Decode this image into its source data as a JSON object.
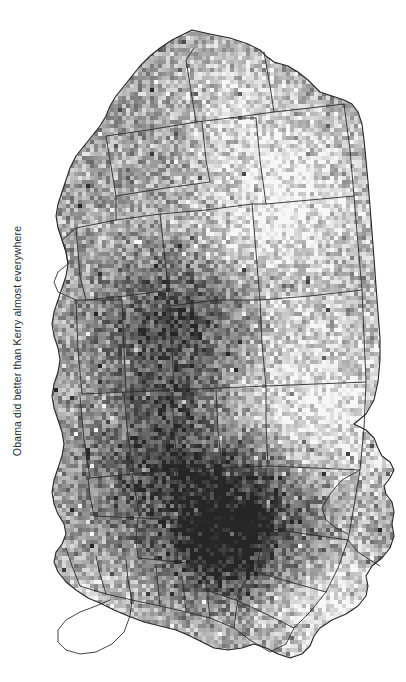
{
  "figure": {
    "caption": "Obama did better than Kerry almost everywhere",
    "caption_orientation": "vertical-rotated-90-ccw",
    "background_color": "#ffffff",
    "text_color": "#2b2b2b"
  },
  "chart_data": {
    "type": "heatmap",
    "subtype": "choropleth-county-map",
    "title": "Obama did better than Kerry almost everywhere",
    "subtitle": "",
    "xlabel": "",
    "ylabel": "",
    "region": "United States (contiguous 48 states), county level",
    "map_rotation_degrees": -90,
    "grid": false,
    "legend": false,
    "legend_position": "none",
    "colormap": "grayscale",
    "colormap_low": "#f7f7f7",
    "colormap_high": "#262626",
    "border_color": "#2e2e2e",
    "value_description": "Swing toward Obama in 2008 relative to Kerry in 2004, by county",
    "value_unit": "percentage points",
    "value_range": [
      -10,
      35
    ],
    "series": [
      {
        "name": "County swing (Obama 2008 minus Kerry 2004)",
        "units": "percentage points"
      }
    ],
    "regions": [
      {
        "name": "Appalachia / Eastern Kentucky",
        "shade": "dark",
        "note": "strong swing away from Obama"
      },
      {
        "name": "Deep South (Alabama, Mississippi, Louisiana, Arkansas)",
        "shade": "dark",
        "note": "swing away from Obama"
      },
      {
        "name": "Oklahoma and Texas Panhandle",
        "shade": "dark",
        "note": "swing away from Obama"
      },
      {
        "name": "Upper Midwest and Plains",
        "shade": "light",
        "note": "swing toward Obama"
      },
      {
        "name": "Mountain West (Colorado, Nevada, New Mexico)",
        "shade": "light",
        "note": "large swing toward Obama"
      },
      {
        "name": "New England and Mid-Atlantic",
        "shade": "light",
        "note": "swing toward Obama"
      },
      {
        "name": "Florida peninsula",
        "shade": "light",
        "note": "swing toward Obama"
      },
      {
        "name": "Pacific Coast",
        "shade": "medium-light",
        "note": "modest swing toward Obama"
      }
    ],
    "annotations": [
      {
        "text": "Obama did better than Kerry almost everywhere",
        "position": "left-margin-rotated"
      }
    ]
  }
}
